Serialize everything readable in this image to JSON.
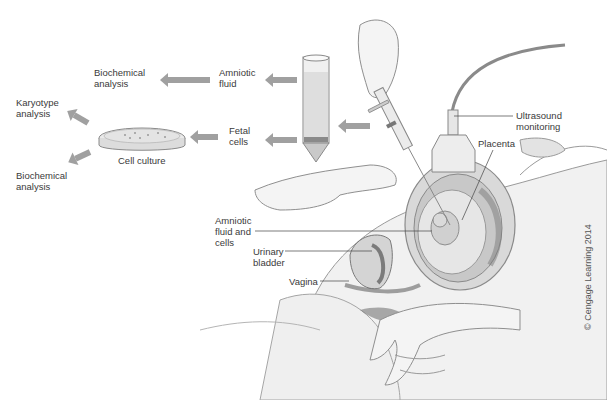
{
  "figure": {
    "credit": "© Cengage Learning 2014"
  },
  "labels": {
    "biochemical_analysis_top": "Biochemical\nanalysis",
    "amniotic_fluid": "Amniotic\nfluid",
    "karyotype_analysis": "Karyotype\nanalysis",
    "cell_culture": "Cell culture",
    "fetal_cells": "Fetal\ncells",
    "biochemical_analysis_bottom": "Biochemical\nanalysis",
    "ultrasound_monitoring": "Ultrasound\nmonitoring",
    "placenta": "Placenta",
    "amniotic_fluid_and_cells": "Amniotic\nfluid and\ncells",
    "urinary_bladder": "Urinary\nbladder",
    "vagina": "Vagina"
  },
  "colors": {
    "arrow": "#9a9a9a",
    "skin": "#ececec",
    "outline": "#8a8a8a",
    "tissue_dark": "#6f6f6f",
    "tissue_mid": "#bdbdbd",
    "leader_line": "#444444"
  }
}
